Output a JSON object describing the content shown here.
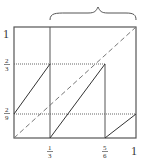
{
  "diagram": {
    "type": "piecewise-map-graph",
    "y_labels": {
      "one": "1",
      "two_thirds_num": "2",
      "two_thirds_den": "3",
      "two_ninths_num": "2",
      "two_ninths_den": "9"
    },
    "x_labels": {
      "one_third_num": "1",
      "one_third_den": "3",
      "five_sixths_num": "5",
      "five_sixths_den": "6",
      "one": "1"
    },
    "colors": {
      "frame": "#555555",
      "line": "#333333",
      "dashed": "#777777",
      "dotted": "#666666"
    }
  }
}
